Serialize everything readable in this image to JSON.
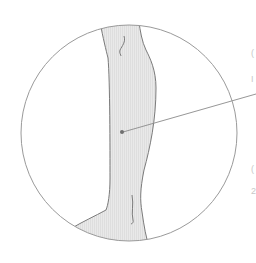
{
  "figure": {
    "colors": {
      "background": "#ffffff",
      "circle_stroke": "#9a9a9a",
      "leg_fill": "#e6e6e6",
      "leg_stroke": "#7a7a7a",
      "pointer_dot": "#707070",
      "pointer_line": "#8a8a8a"
    }
  },
  "edge_fragments": [
    "(",
    "I",
    "(",
    "2"
  ]
}
